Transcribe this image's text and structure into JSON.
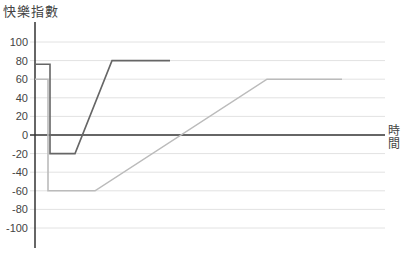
{
  "chart_data": {
    "type": "line",
    "title": "",
    "ylabel": "快樂指數",
    "xlabel": "時間",
    "ylim": [
      -120,
      120
    ],
    "yticks": [
      100,
      80,
      60,
      40,
      20,
      0,
      -20,
      -40,
      -60,
      -80,
      -100
    ],
    "grid": true,
    "legend": null,
    "series": [
      {
        "name": "dark",
        "color": "#666666",
        "points": [
          [
            0,
            76
          ],
          [
            15,
            76
          ],
          [
            15,
            -20
          ],
          [
            40,
            -20
          ],
          [
            77,
            80
          ],
          [
            135,
            80
          ]
        ]
      },
      {
        "name": "light",
        "color": "#bbbbbb",
        "points": [
          [
            0,
            60
          ],
          [
            13,
            60
          ],
          [
            13,
            -60
          ],
          [
            60,
            -60
          ],
          [
            232,
            60
          ],
          [
            307,
            60
          ]
        ]
      }
    ]
  }
}
